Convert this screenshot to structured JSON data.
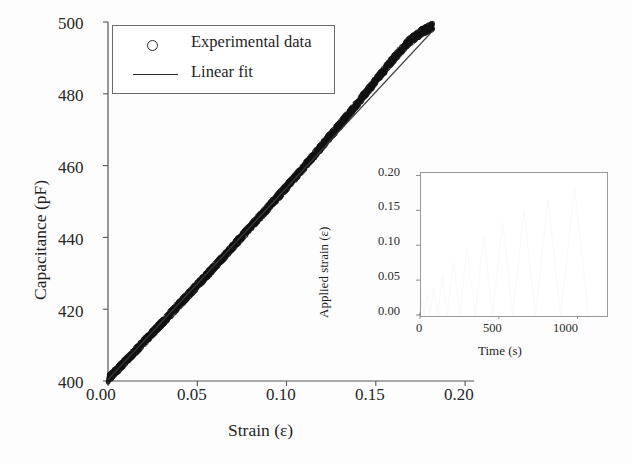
{
  "chart_data": [
    {
      "id": "main",
      "type": "scatter",
      "title": "",
      "xlabel": "Strain (ε)",
      "ylabel": "Capacitance (pF)",
      "xlim": [
        0.0,
        0.205
      ],
      "ylim": [
        400,
        500
      ],
      "xticks": [
        0.0,
        0.05,
        0.1,
        0.15,
        0.2
      ],
      "xtick_labels": [
        "0.00",
        "0.05",
        "0.10",
        "0.15",
        "0.20"
      ],
      "yticks": [
        400,
        420,
        440,
        460,
        480,
        500
      ],
      "ytick_labels": [
        "400",
        "420",
        "440",
        "460",
        "480",
        "500"
      ],
      "grid": false,
      "legend_position": "upper left",
      "series": [
        {
          "name": "Experimental data",
          "marker": "open-circle",
          "style": "dense-band",
          "x": [
            0.0,
            0.008,
            0.016,
            0.024,
            0.032,
            0.04,
            0.048,
            0.056,
            0.064,
            0.072,
            0.08,
            0.088,
            0.096,
            0.104,
            0.112,
            0.12,
            0.128,
            0.136,
            0.144,
            0.152,
            0.16,
            0.168,
            0.176,
            0.182
          ],
          "values": [
            400.5,
            404.6,
            408.7,
            412.9,
            417.1,
            421.4,
            425.6,
            429.9,
            434.2,
            438.6,
            443.0,
            447.4,
            451.8,
            456.3,
            460.9,
            465.6,
            470.3,
            475.1,
            480.0,
            484.9,
            489.8,
            494.3,
            497.4,
            498.8
          ],
          "band_halfwidth": 1.1
        },
        {
          "name": "Linear fit",
          "marker": "line",
          "slope": 534.0,
          "intercept": 400.4,
          "x": [
            0.0,
            0.182
          ],
          "values": [
            400.4,
            497.6
          ]
        }
      ]
    },
    {
      "id": "inset",
      "type": "line",
      "title": "",
      "xlabel": "Time (s)",
      "ylabel": "Applied strain (ε)",
      "xlim": [
        0,
        1180
      ],
      "ylim": [
        0.0,
        0.205
      ],
      "xticks": [
        0,
        500,
        1000
      ],
      "xtick_labels": [
        "0",
        "500",
        "1000"
      ],
      "yticks": [
        0.0,
        0.05,
        0.1,
        0.15,
        0.2
      ],
      "ytick_labels": [
        "0.00",
        "0.05",
        "0.10",
        "0.15",
        "0.20"
      ],
      "grid": false,
      "legend_position": "none",
      "series": [
        {
          "name": "Applied strain",
          "marker": "line",
          "x": [
            0,
            14,
            28,
            46,
            64,
            88,
            112,
            142,
            172,
            212,
            252,
            300,
            348,
            404,
            460,
            524,
            588,
            660,
            732,
            812,
            892,
            980,
            1068,
            1168
          ],
          "values": [
            0.0,
            0.022,
            0.0,
            0.03,
            0.0,
            0.04,
            0.0,
            0.058,
            0.0,
            0.077,
            0.0,
            0.096,
            0.0,
            0.114,
            0.0,
            0.133,
            0.0,
            0.15,
            0.0,
            0.167,
            0.0,
            0.185,
            0.0,
            0.0
          ],
          "peaks": [
            0.022,
            0.03,
            0.04,
            0.058,
            0.077,
            0.096,
            0.114,
            0.133,
            0.15,
            0.167,
            0.185
          ]
        }
      ]
    }
  ],
  "main_axis": {
    "x_title": "Strain (ε)",
    "y_title": "Capacitance (pF)",
    "x_tick_labels": [
      "0.00",
      "0.05",
      "0.10",
      "0.15",
      "0.20"
    ],
    "y_tick_labels": [
      "500",
      "480",
      "460",
      "440",
      "420",
      "400"
    ]
  },
  "legend": {
    "entries": [
      {
        "label": "Experimental data",
        "marker": "open-circle"
      },
      {
        "label": "Linear fit",
        "marker": "line"
      }
    ]
  },
  "inset_axis": {
    "x_title": "Time (s)",
    "y_title": "Applied strain (ε)",
    "x_tick_labels": [
      "0",
      "500",
      "1000"
    ],
    "y_tick_labels": [
      "0.20",
      "0.15",
      "0.10",
      "0.05",
      "0.00"
    ]
  },
  "colors": {
    "data_band": "#111111",
    "fit_line": "#3a3a3a",
    "axis": "#555555",
    "inset_line": "#404040",
    "text": "#1f1f1f",
    "background": "#fdfdfd"
  }
}
